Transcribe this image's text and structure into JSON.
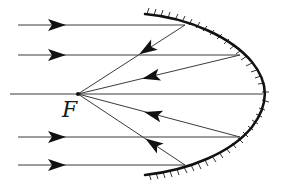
{
  "diagram": {
    "focus_label": "F",
    "colors": {
      "ray": "#3a3a3a",
      "mirror": "#111111",
      "hatch": "#333333",
      "arrow": "#111111",
      "background": "#ffffff"
    },
    "focus_point": [
      78,
      94
    ],
    "mirror": {
      "vertex": [
        263,
        94
      ],
      "top_end": [
        145,
        15
      ],
      "bottom_end": [
        145,
        175
      ]
    },
    "incident_rays": [
      {
        "y": 25,
        "hit": [
          185,
          25
        ]
      },
      {
        "y": 55,
        "hit": [
          240,
          55
        ]
      },
      {
        "y": 94,
        "hit": [
          263,
          94
        ]
      },
      {
        "y": 137,
        "hit": [
          240,
          137
        ]
      },
      {
        "y": 165,
        "hit": [
          185,
          165
        ]
      }
    ]
  }
}
